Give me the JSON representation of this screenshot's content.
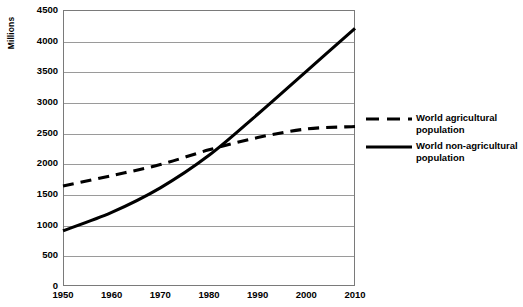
{
  "chart_data": {
    "type": "line",
    "title": "",
    "xlabel": "",
    "ylabel": "Millions",
    "x": [
      1950,
      1960,
      1970,
      1980,
      1990,
      2000,
      2010
    ],
    "categories": [
      "1950",
      "1960",
      "1970",
      "1980",
      "1990",
      "2000",
      "2010"
    ],
    "xlim": [
      1950,
      2010
    ],
    "ylim": [
      0,
      4500
    ],
    "y_ticks": [
      0,
      500,
      1000,
      1500,
      2000,
      2500,
      3000,
      3500,
      4000,
      4500
    ],
    "y_tick_labels": [
      "0",
      "500",
      "1000",
      "1500",
      "2000",
      "2500",
      "3000",
      "3500",
      "4000",
      "4500"
    ],
    "grid": true,
    "legend_position": "right",
    "series": [
      {
        "name": "World agricultural population",
        "style": "dashed",
        "color": "#000000",
        "values": [
          1630,
          1800,
          1980,
          2220,
          2420,
          2560,
          2600
        ]
      },
      {
        "name": "World non-agricultural population",
        "style": "solid",
        "color": "#000000",
        "values": [
          900,
          1200,
          1600,
          2130,
          2800,
          3500,
          4200
        ]
      }
    ]
  },
  "axes": {
    "y_title": "Millions"
  },
  "legend": {
    "items": [
      {
        "label": "World agricultural population",
        "swatch": "dashed-line-swatch"
      },
      {
        "label": "World non-agricultural population",
        "swatch": "solid-line-swatch"
      }
    ]
  }
}
